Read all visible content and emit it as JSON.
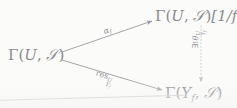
{
  "diagram": {
    "kind": "commutative-triangle",
    "ink_color": "#8d8f93",
    "background_color": "#fbfbfa",
    "nodes": [
      {
        "id": "source",
        "name": "gamma-u-s",
        "text": "Γ(U, 𝒞)",
        "gamma": "Γ",
        "open_paren": "(",
        "first": "U",
        "comma": ", ",
        "sheaf": "𝒮",
        "close_paren": ")",
        "suffix": ""
      },
      {
        "id": "localization",
        "name": "gamma-u-s-localized",
        "text": "Γ(U, 𝒮)[1/f]",
        "gamma": "Γ",
        "open_paren": "(",
        "first": "U",
        "comma": ", ",
        "sheaf": "𝒮",
        "close_paren": ")",
        "suffix": "[1/f]"
      },
      {
        "id": "sections",
        "name": "gamma-yf-s",
        "text": "Γ(Y_f, 𝒮)",
        "gamma": "Γ",
        "open_paren": "(",
        "first": "Y",
        "first_sub": "f",
        "comma": ", ",
        "sheaf": "𝒮",
        "close_paren": ")",
        "suffix": ""
      }
    ],
    "arrows": [
      {
        "id": "alpha",
        "name": "arrow-alpha-f",
        "from": "source",
        "to": "localization",
        "style": "solid",
        "label_base": "α",
        "label_sub": "f",
        "label_sup": "",
        "label_text": "α_f"
      },
      {
        "id": "restriction",
        "name": "arrow-restriction",
        "from": "source",
        "to": "sections",
        "style": "solid",
        "label_base": "res",
        "label_sub": "Y",
        "label_sub_sub": "f",
        "label_sup": "U",
        "label_text": "res^U_{Y_f}"
      },
      {
        "id": "theta",
        "name": "arrow-unique-theta",
        "from": "localization",
        "to": "sections",
        "style": "dotted",
        "label_quantifier": "∃!",
        "label_base": "θ",
        "label_sub": "Y",
        "label_sub_sub": "f",
        "label_sup": "U",
        "label_text": "∃!θ^U_{Y_f}"
      }
    ]
  }
}
